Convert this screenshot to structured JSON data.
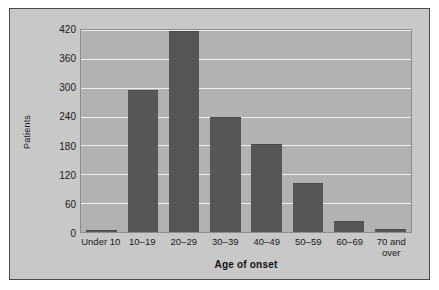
{
  "chart_data": {
    "type": "bar",
    "title": "",
    "xlabel": "Age of onset",
    "ylabel": "Patients",
    "categories": [
      "Under 10",
      "10–19",
      "20–29",
      "30–39",
      "40–49",
      "50–59",
      "60–69",
      "70 and\nover"
    ],
    "values": [
      5,
      296,
      417,
      239,
      183,
      101,
      23,
      6
    ],
    "ylim": [
      0,
      420
    ],
    "yticks": [
      0,
      60,
      120,
      180,
      240,
      300,
      360,
      420
    ],
    "ytick_labels": [
      "0",
      "60",
      "120",
      "180",
      "240",
      "300",
      "360",
      "420"
    ],
    "grid": true,
    "legend": null,
    "colors": {
      "bar": "#565656",
      "plot_background": "#b2b2b2",
      "figure_background": "#c8c8c8",
      "gridline": "#efefef",
      "text": "#1b1b1b",
      "frame": "#4a4a4a"
    }
  }
}
